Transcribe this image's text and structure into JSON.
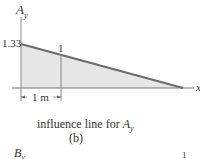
{
  "diagram": {
    "y_axis_label_main": "A",
    "y_axis_label_sub": "y",
    "x_axis_label": "x",
    "value_at_origin": "1.33",
    "value_at_1m": "1",
    "dimension_label": "1 m",
    "caption_prefix": "influence line for ",
    "caption_var_main": "A",
    "caption_var_sub": "y",
    "subfigure_label": "(b)",
    "next_label_main": "B",
    "next_label_sub": "y",
    "next_value": "1",
    "colors": {
      "line": "#6b6b6b",
      "fill": "#e6e6e6",
      "axis": "#777777"
    }
  }
}
